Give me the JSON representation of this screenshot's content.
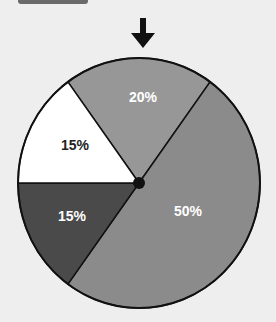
{
  "header": {
    "tab_label": ""
  },
  "colors": {
    "background": "#eeeeee",
    "outline": "#111111",
    "arrow": "#111111",
    "hub": "#111111"
  },
  "chart_data": {
    "type": "pie",
    "title": "",
    "start_angle_deg_from_top": -36,
    "slices": [
      {
        "label": "20%",
        "value": 20,
        "color": "#979797",
        "text_color": "#ffffff"
      },
      {
        "label": "50%",
        "value": 50,
        "color": "#8b8b8b",
        "text_color": "#ffffff"
      },
      {
        "label": "15%",
        "value": 15,
        "color": "#4a4a4a",
        "text_color": "#ffffff"
      },
      {
        "label": "15%",
        "value": 15,
        "color": "#ffffff",
        "text_color": "#222222"
      }
    ],
    "annotations": [
      {
        "type": "arrow-pointer",
        "position": "top",
        "points_at": "20%"
      }
    ],
    "legend": "none"
  }
}
